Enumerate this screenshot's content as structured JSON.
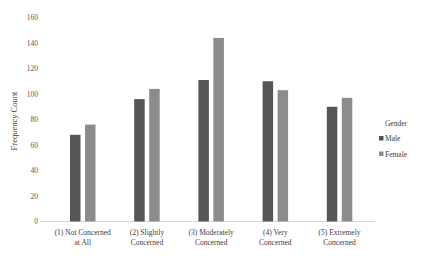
{
  "chart_data": {
    "type": "bar",
    "title": "",
    "xlabel": "",
    "ylabel": "Frequency Count",
    "ylim": [
      0,
      160
    ],
    "yticks": [
      0,
      20,
      40,
      60,
      80,
      100,
      120,
      140,
      160
    ],
    "grid": false,
    "legend_position": "right",
    "legend_title": "Gender",
    "categories": [
      [
        "(1) Not Concerned",
        "at All"
      ],
      [
        "(2) Slightly",
        "Concerned"
      ],
      [
        "(3) Moderately",
        "Concerned"
      ],
      [
        "(4) Very",
        "Concerned"
      ],
      [
        "(5) Extremely",
        "Concerned"
      ]
    ],
    "series": [
      {
        "name": "Male",
        "color": "#555555",
        "values": [
          68,
          96,
          111,
          110,
          90
        ]
      },
      {
        "name": "Female",
        "color": "#8c8c8c",
        "values": [
          76,
          104,
          144,
          103,
          97
        ]
      }
    ]
  }
}
